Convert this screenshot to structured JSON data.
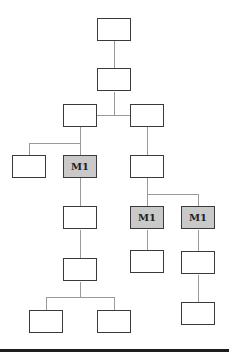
{
  "diagram": {
    "type": "tree",
    "nodes": [
      {
        "id": "n1",
        "label": "",
        "marked": false,
        "x": 97,
        "y": 18
      },
      {
        "id": "n2",
        "label": "",
        "marked": false,
        "x": 97,
        "y": 68
      },
      {
        "id": "n3",
        "label": "",
        "marked": false,
        "x": 63,
        "y": 104
      },
      {
        "id": "n4",
        "label": "",
        "marked": false,
        "x": 130,
        "y": 104
      },
      {
        "id": "n5",
        "label": "",
        "marked": false,
        "x": 12,
        "y": 155
      },
      {
        "id": "n6",
        "label": "M1",
        "marked": true,
        "x": 63,
        "y": 155
      },
      {
        "id": "n7",
        "label": "",
        "marked": false,
        "x": 130,
        "y": 155
      },
      {
        "id": "n8",
        "label": "",
        "marked": false,
        "x": 63,
        "y": 206
      },
      {
        "id": "n9",
        "label": "M1",
        "marked": true,
        "x": 130,
        "y": 206
      },
      {
        "id": "n10",
        "label": "M1",
        "marked": true,
        "x": 181,
        "y": 206
      },
      {
        "id": "n11",
        "label": "",
        "marked": false,
        "x": 130,
        "y": 250
      },
      {
        "id": "n12",
        "label": "",
        "marked": false,
        "x": 181,
        "y": 251
      },
      {
        "id": "n13",
        "label": "",
        "marked": false,
        "x": 63,
        "y": 258
      },
      {
        "id": "n14",
        "label": "",
        "marked": false,
        "x": 181,
        "y": 302
      },
      {
        "id": "n15",
        "label": "",
        "marked": false,
        "x": 29,
        "y": 310
      },
      {
        "id": "n16",
        "label": "",
        "marked": false,
        "x": 97,
        "y": 310
      }
    ],
    "edges": [
      [
        "n1",
        "n2"
      ],
      [
        "n2",
        "n3"
      ],
      [
        "n2",
        "n4"
      ],
      [
        "n3",
        "n5"
      ],
      [
        "n3",
        "n6"
      ],
      [
        "n4",
        "n7"
      ],
      [
        "n6",
        "n8"
      ],
      [
        "n7",
        "n9"
      ],
      [
        "n7",
        "n10"
      ],
      [
        "n9",
        "n11"
      ],
      [
        "n10",
        "n12"
      ],
      [
        "n8",
        "n13"
      ],
      [
        "n12",
        "n14"
      ],
      [
        "n13",
        "n15"
      ],
      [
        "n13",
        "n16"
      ]
    ],
    "colors": {
      "marked_fill": "#c9c9c9",
      "border": "#3a3a3a",
      "connector": "#9a9a9a",
      "rule": "#1e1e1e"
    }
  }
}
